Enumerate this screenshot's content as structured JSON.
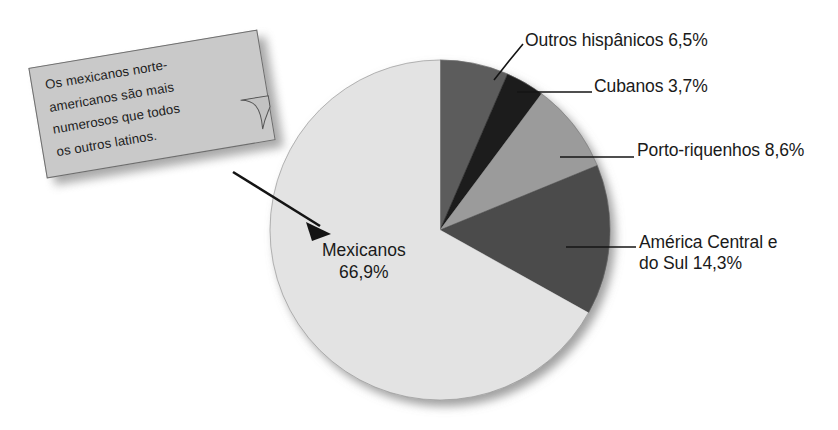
{
  "chart_data": {
    "type": "pie",
    "title": "",
    "subtitle": "",
    "xlabel": "",
    "ylabel": "",
    "unit": "%",
    "legend_position": "callout-labels",
    "grid": false,
    "categories": [
      "Mexicanos",
      "Outros hispânicos",
      "Cubanos",
      "Porto-riquenhos",
      "América Central e do Sul"
    ],
    "values": [
      66.9,
      6.5,
      3.7,
      8.6,
      14.3
    ],
    "value_labels": [
      "66,9%",
      "6,5%",
      "3,7%",
      "8,6%",
      "14,3%"
    ],
    "slices": [
      {
        "name": "outros-hispanicos",
        "label": "Outros hispânicos",
        "value": 6.5,
        "value_label": "6,5%",
        "full_label": "Outros hispânicos 6,5%",
        "color": "#5c5c5c",
        "start_angle": 0.0,
        "end_angle": 23.4
      },
      {
        "name": "cubanos",
        "label": "Cubanos",
        "value": 3.7,
        "value_label": "3,7%",
        "full_label": "Cubanos 3,7%",
        "color": "#1f1f1f",
        "start_angle": 23.4,
        "end_angle": 36.7
      },
      {
        "name": "porto-riquenhos",
        "label": "Porto-riquenhos",
        "value": 8.6,
        "value_label": "8,6%",
        "full_label": "Porto-riquenhos 8,6%",
        "color": "#9b9b9b",
        "start_angle": 36.7,
        "end_angle": 67.7
      },
      {
        "name": "america-central-e-do-sul",
        "label": "América Central e do Sul",
        "value": 14.3,
        "value_label": "14,3%",
        "full_label": "América Central e do Sul 14,3%",
        "color": "#4b4b4b",
        "start_angle": 67.7,
        "end_angle": 119.2
      },
      {
        "name": "mexicanos",
        "label": "Mexicanos",
        "value": 66.9,
        "value_label": "66,9%",
        "full_label": "Mexicanos 66,9%",
        "color": "#e3e3e3",
        "start_angle": 119.2,
        "end_angle": 360.0
      }
    ]
  },
  "labels": {
    "outros_hispanicos": "Outros hispânicos 6,5%",
    "cubanos": "Cubanos 3,7%",
    "porto_riquenhos": "Porto-riquenhos 8,6%",
    "america_central_line1": "América Central e",
    "america_central_line2": "do Sul 14,3%",
    "mexicanos_line1": "Mexicanos",
    "mexicanos_line2": "66,9%"
  },
  "callout": {
    "line1": "Os mexicanos norte-",
    "line2": "americanos são mais",
    "line3": "numerosos que todos",
    "line4": "os outros latinos.",
    "full_text": "Os mexicanos norte-americanos são mais numerosos que todos os outros latinos.",
    "fill_color": "#c9c9c9",
    "border_color": "#6e6e6e"
  },
  "colors": {
    "background": "#ffffff",
    "text": "#1a1a1a",
    "leader_line": "#141414",
    "pie_outline": "#6f6f6f"
  }
}
